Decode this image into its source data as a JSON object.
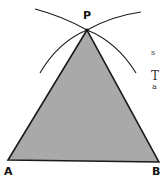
{
  "figure": {
    "type": "geometric-construction",
    "colors": {
      "fill": "#a9a9a9",
      "stroke": "#1a1a1a",
      "background": "#ffffff"
    },
    "vertices": [
      {
        "name": "P",
        "label": "P",
        "x": 87,
        "y": 30
      },
      {
        "name": "A",
        "label": "A",
        "x": 8,
        "y": 160
      },
      {
        "name": "B",
        "label": "B",
        "x": 159,
        "y": 162
      }
    ],
    "arcs": [
      {
        "name": "arc-from-A-upper",
        "description": "arc crossing above P"
      },
      {
        "name": "arc-from-B-upper",
        "description": "arc crossing above P"
      },
      {
        "name": "arc-left-lower",
        "description": "arc descending left from P"
      },
      {
        "name": "arc-right-lower",
        "description": "arc descending right from P"
      }
    ]
  },
  "side_text_fragments": [
    "s",
    "T",
    "a"
  ]
}
